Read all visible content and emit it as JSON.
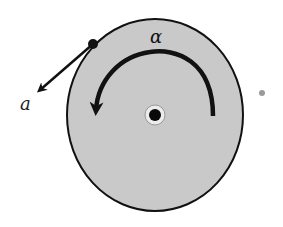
{
  "diagram": {
    "labels": {
      "angular_acceleration": "α",
      "tangential_acceleration": "a"
    },
    "colors": {
      "disk_fill": "#c9c9c9",
      "outline": "#111111",
      "background": "#ffffff",
      "axle_ring": "#e8e8e8",
      "stray_dot": "#9a9a9a"
    },
    "elements": {
      "disk": {
        "cx": 155,
        "cy": 115,
        "rx": 88,
        "ry": 96
      },
      "axle": {
        "cx": 155,
        "cy": 115,
        "outer_r": 10,
        "inner_r": 6
      },
      "rim_point": {
        "cx": 93,
        "cy": 44,
        "r": 5
      },
      "tangential_arrow": {
        "from": [
          93,
          44
        ],
        "to": [
          37,
          92
        ]
      },
      "angular_arrow": {
        "direction": "counterclockwise",
        "start": [
          213,
          116
        ],
        "end": [
          96,
          110
        ]
      },
      "stray_dot": {
        "cx": 262,
        "cy": 93,
        "r": 3
      }
    }
  }
}
